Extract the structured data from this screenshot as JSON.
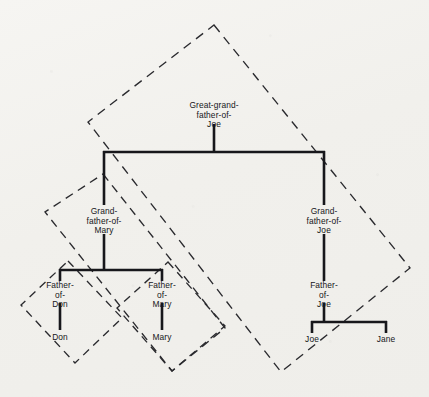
{
  "figure": {
    "kind": "family-tree-with-dashed-subtree-enclosures",
    "background_color": "#f3f2ef",
    "line_color": "#17171b",
    "dashed_color": "#2a2a2e",
    "top_edge_artifact": ""
  },
  "nodes": {
    "root": {
      "id": "great-grandfather-of-joe",
      "label_lines": "Great-grand-\nfather-of-\nJoe",
      "x": 214,
      "y": 116
    },
    "grandfather_of_mary": {
      "id": "grandfather-of-mary",
      "label_lines": "Grand-\nfather-of-\nMary",
      "x": 104,
      "y": 222
    },
    "grandfather_of_joe": {
      "id": "grandfather-of-joe",
      "label_lines": "Grand-\nfather-of-\nJoe",
      "x": 324,
      "y": 222
    },
    "father_of_don": {
      "id": "father-of-don",
      "label_lines": "Father-\nof-\nDon",
      "x": 60,
      "y": 291
    },
    "father_of_mary": {
      "id": "father-of-mary",
      "label_lines": "Father-\nof-\nMary",
      "x": 162,
      "y": 291
    },
    "father_of_joe": {
      "id": "father-of-joe",
      "label_lines": "Father-\nof-\nJoe",
      "x": 324,
      "y": 291
    },
    "don": {
      "id": "don",
      "label": "Don",
      "x": 60,
      "y": 339
    },
    "mary": {
      "id": "mary",
      "label": "Mary",
      "x": 162,
      "y": 339
    },
    "joe": {
      "id": "joe",
      "label": "Joe",
      "x": 312,
      "y": 341
    },
    "jane": {
      "id": "jane",
      "label": "Jane",
      "x": 386,
      "y": 341
    }
  },
  "edges": [
    {
      "from": "great-grandfather-of-joe",
      "to": "grandfather-of-mary"
    },
    {
      "from": "great-grandfather-of-joe",
      "to": "grandfather-of-joe"
    },
    {
      "from": "grandfather-of-mary",
      "to": "father-of-don"
    },
    {
      "from": "grandfather-of-mary",
      "to": "father-of-mary"
    },
    {
      "from": "grandfather-of-joe",
      "to": "father-of-joe"
    },
    {
      "from": "father-of-don",
      "to": "don"
    },
    {
      "from": "father-of-mary",
      "to": "mary"
    },
    {
      "from": "father-of-joe",
      "to": "joe"
    },
    {
      "from": "father-of-joe",
      "to": "jane"
    }
  ],
  "enclosures": [
    {
      "id": "enclosure-great-grandfather-of-joe",
      "covers": "Great-grand-father-of-Joe",
      "points": "214,25 410,268 281,372 88,122"
    },
    {
      "id": "enclosure-grandfather-of-mary",
      "covers": "Grand-father-of-Mary",
      "points": "103,174 225,328 172,371 45,212"
    },
    {
      "id": "enclosure-father-of-mary",
      "covers": "Father-of-Mary",
      "points": "168,262 225,326 172,371 117,308"
    },
    {
      "id": "enclosure-father-of-don",
      "covers": "Father-of-Don",
      "points": "68,261 122,318 75,363 21,305"
    }
  ],
  "connectors": {
    "root_stem": "214,124 214,152",
    "root_bus": "104,152 324,152",
    "root_bus_left_drop": "104,152 104,205",
    "root_bus_right_drop": "324,152 324,205",
    "gfm_stem": "104,234 104,270",
    "gfm_bus": "60,270 162,270",
    "gfm_left_drop": "60,270 60,281",
    "gfm_right_drop": "162,270 162,281",
    "gfj_stem": "324,234 324,281",
    "fod_stem": "60,303 60,330",
    "fom_stem": "162,303 162,330",
    "foj_stem": "324,303 324,322",
    "foj_bus": "312,322 386,322",
    "foj_left_drop": "312,322 312,333",
    "foj_right_drop": "386,322 386,333"
  }
}
